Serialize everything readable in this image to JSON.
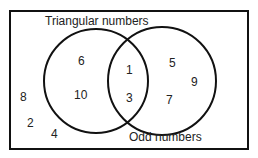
{
  "diagram": {
    "type": "venn",
    "sets": [
      {
        "name": "Triangular numbers",
        "only": [
          "6",
          "10"
        ]
      },
      {
        "name": "Odd numbers",
        "only": [
          "5",
          "9",
          "7"
        ]
      }
    ],
    "intersection": [
      "1",
      "3"
    ],
    "outside": [
      "8",
      "2",
      "4"
    ]
  },
  "labels": {
    "left": "Triangular numbers",
    "right": "Odd numbers"
  },
  "numbers": {
    "n6": "6",
    "n10": "10",
    "n1": "1",
    "n3": "3",
    "n5": "5",
    "n9": "9",
    "n7": "7",
    "n8": "8",
    "n2": "2",
    "n4": "4"
  }
}
